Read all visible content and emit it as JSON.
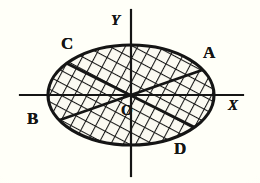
{
  "figure": {
    "kind": "geometry-diagram",
    "background_color": "#fdfcf4",
    "ink_color": "#151515"
  },
  "axes": {
    "x_label": "X",
    "y_label": "Y",
    "origin_label": "O",
    "x_line": {
      "x1": 20,
      "y1": 95,
      "x2": 243,
      "y2": 95
    },
    "y_line": {
      "x1": 131,
      "y1": 10,
      "x2": 131,
      "y2": 176
    },
    "line_width": 2.2
  },
  "ellipse": {
    "cx": 131,
    "cy": 95,
    "rx": 83,
    "ry": 50,
    "stroke_width": 3.2,
    "fill": "#fbfaf2"
  },
  "points": [
    {
      "id": "A",
      "label": "A",
      "position": "upper-right",
      "x": 203,
      "y": 44
    },
    {
      "id": "B",
      "label": "B",
      "position": "lower-left",
      "x": 27,
      "y": 110
    },
    {
      "id": "C",
      "label": "C",
      "position": "upper-left",
      "x": 61,
      "y": 35
    },
    {
      "id": "D",
      "label": "D",
      "position": "lower-right",
      "x": 174,
      "y": 140
    },
    {
      "id": "O",
      "label": "O",
      "position": "origin",
      "x": 121,
      "y": 103
    }
  ],
  "chords": [
    {
      "id": "chord-BA",
      "from": "B",
      "to": "A",
      "x1": 54,
      "y1": 122,
      "x2": 208,
      "y2": 68,
      "stroke_width": 2.6
    },
    {
      "id": "chord-CD",
      "from": "C",
      "to": "D",
      "x1": 66,
      "y1": 63,
      "x2": 196,
      "y2": 128,
      "stroke_width": 2.6
    }
  ],
  "hatching": {
    "style": "cross-hatch",
    "pattern": "diamond-mesh",
    "spacing_px": 11,
    "line_width": 2.1,
    "angles_deg": [
      28,
      -28
    ]
  }
}
